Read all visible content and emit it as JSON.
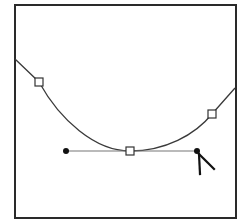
{
  "diagram": {
    "type": "bezier-path-editing",
    "colors": {
      "background": "#ffffff",
      "frame": "#2a2a2a",
      "curve": "#3a3a3a",
      "handle_line": "#777777",
      "anchor_fill": "#ffffff",
      "anchor_stroke": "#333333",
      "handle_point": "#111111",
      "cursor": "#111111"
    },
    "frame": {
      "x": 15,
      "y": 5,
      "width": 221,
      "height": 213
    },
    "anchors": [
      {
        "name": "left-anchor",
        "x": 39,
        "y": 82
      },
      {
        "name": "bottom-anchor",
        "x": 130,
        "y": 151
      },
      {
        "name": "right-anchor",
        "x": 212,
        "y": 114
      }
    ],
    "handle": {
      "start": {
        "x": 66,
        "y": 151
      },
      "end": {
        "x": 197,
        "y": 151
      }
    },
    "cursor": {
      "type": "direct-selection-arrow",
      "x": 199,
      "y": 153
    }
  }
}
